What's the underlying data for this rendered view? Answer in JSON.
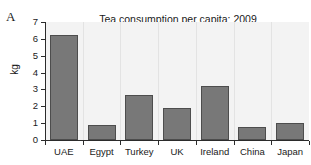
{
  "panel": {
    "label": "A"
  },
  "chart_data": {
    "type": "bar",
    "title": "Tea consumption per capita: 2009",
    "xlabel": "",
    "ylabel": "kg",
    "categories": [
      "UAE",
      "Egypt",
      "Turkey",
      "UK",
      "Ireland",
      "China",
      "Japan"
    ],
    "values": [
      6.25,
      0.9,
      2.7,
      1.9,
      3.2,
      0.8,
      1.0
    ],
    "ylim": [
      0,
      7
    ],
    "yticks": [
      0,
      1,
      2,
      3,
      4,
      5,
      6,
      7
    ],
    "ytick_labels": [
      "0",
      "1",
      "2",
      "3",
      "4",
      "5",
      "6",
      "7"
    ],
    "grid": "vertical-faint",
    "legend": null,
    "bar_color": "#787878",
    "bar_edge_color": "#4d4d4d",
    "plot_background": "#f3f3f3",
    "axis_color": "#2b2b2b"
  }
}
